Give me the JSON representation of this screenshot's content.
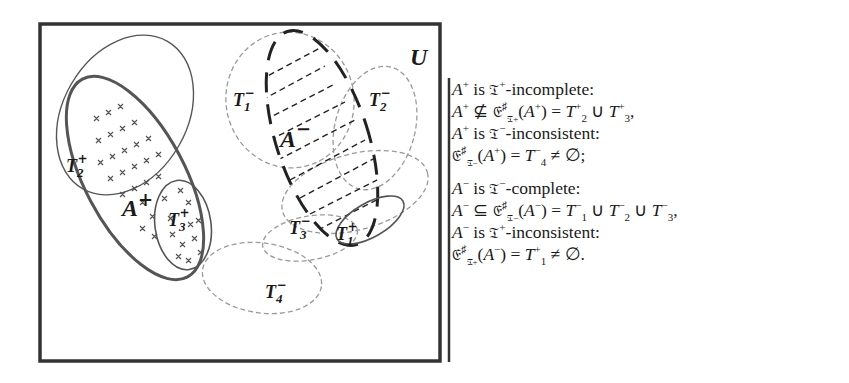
{
  "diagram": {
    "universe_label": "U",
    "colors": {
      "frame": "#333333",
      "solid_set": "#555555",
      "dashed_set": "#9a9a9a",
      "a_minus_outline": "#222222",
      "text": "#1a1a1a"
    },
    "sets": [
      {
        "id": "A+",
        "label": "A",
        "sup": "+",
        "style": "thick-solid",
        "fill_pattern": "crosses"
      },
      {
        "id": "A-",
        "label": "A",
        "sup": "−",
        "style": "thick-long-dash",
        "fill_pattern": "dash-hatch"
      },
      {
        "id": "T2+",
        "label": "T",
        "sub": "2",
        "sup": "+",
        "style": "thin-solid"
      },
      {
        "id": "T3+",
        "label": "T",
        "sub": "3",
        "sup": "+",
        "style": "solid"
      },
      {
        "id": "T1+",
        "label": "T",
        "sub": "1",
        "sup": "+",
        "style": "solid"
      },
      {
        "id": "T1-",
        "label": "T",
        "sub": "1",
        "sup": "−",
        "style": "thin-dashed"
      },
      {
        "id": "T2-",
        "label": "T",
        "sub": "2",
        "sup": "−",
        "style": "thin-dashed"
      },
      {
        "id": "T3-",
        "label": "T",
        "sub": "3",
        "sup": "−",
        "style": "thin-dashed"
      },
      {
        "id": "T4-",
        "label": "T",
        "sub": "4",
        "sup": "−",
        "style": "thin-dashed"
      }
    ]
  },
  "statements": {
    "s1": {
      "subject": "A",
      "subject_sup": "+",
      "is": "is",
      "operator": "𝔗",
      "operator_sup": "+",
      "property": "-incomplete:"
    },
    "s2": {
      "lhs": "A",
      "lhs_sup": "+",
      "rel": "⊈",
      "closure": "𝔈",
      "closure_sup": "♯",
      "closure_sub": "𝔗+",
      "arg_open": "(",
      "arg": "A",
      "arg_sup": "+",
      "arg_close": ")",
      "eq": "=",
      "rhs": [
        {
          "t": "T",
          "sub": "2",
          "sup": "+"
        },
        {
          "t": "T",
          "sub": "3",
          "sup": "+"
        }
      ],
      "union": "∪",
      "tail": ","
    },
    "s3": {
      "subject": "A",
      "subject_sup": "+",
      "is": "is",
      "operator": "𝔗",
      "operator_sup": "−",
      "property": "-inconsistent:"
    },
    "s4": {
      "closure": "𝔈",
      "closure_sup": "♯",
      "closure_sub": "𝔗−",
      "arg_open": "(",
      "arg": "A",
      "arg_sup": "+",
      "arg_close": ")",
      "eq": "=",
      "rhs": {
        "t": "T",
        "sub": "4",
        "sup": "−"
      },
      "neq": "≠",
      "empty": "∅",
      "tail": ";"
    },
    "s5": {
      "subject": "A",
      "subject_sup": "−",
      "is": "is",
      "operator": "𝔗",
      "operator_sup": "−",
      "property": "-complete:"
    },
    "s6": {
      "lhs": "A",
      "lhs_sup": "−",
      "rel": "⊆",
      "closure": "𝔈",
      "closure_sup": "♯",
      "closure_sub": "𝔗−",
      "arg_open": "(",
      "arg": "A",
      "arg_sup": "−",
      "arg_close": ")",
      "eq": "=",
      "rhs": [
        {
          "t": "T",
          "sub": "1",
          "sup": "−"
        },
        {
          "t": "T",
          "sub": "2",
          "sup": "−"
        },
        {
          "t": "T",
          "sub": "3",
          "sup": "−"
        }
      ],
      "union": "∪",
      "tail": ","
    },
    "s7": {
      "subject": "A",
      "subject_sup": "−",
      "is": "is",
      "operator": "𝔗",
      "operator_sup": "+",
      "property": "-inconsistent:"
    },
    "s8": {
      "closure": "𝔈",
      "closure_sup": "♯",
      "closure_sub": "𝔗+",
      "arg_open": "(",
      "arg": "A",
      "arg_sup": "−",
      "arg_close": ")",
      "eq": "=",
      "rhs": {
        "t": "T",
        "sub": "1",
        "sup": "+"
      },
      "neq": "≠",
      "empty": "∅",
      "tail": "."
    }
  }
}
